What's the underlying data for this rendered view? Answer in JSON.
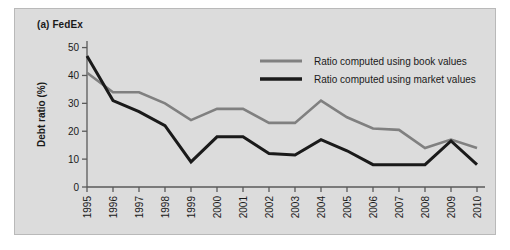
{
  "figure": {
    "panel_label": "(a) FedEx",
    "background_color": "#dcdcdc",
    "border_color": "#b9b9b9"
  },
  "legend": {
    "position": "top-right",
    "entries": [
      {
        "label": "Ratio computed using book values",
        "color": "#808080"
      },
      {
        "label": "Ratio computed using market values",
        "color": "#1a1a1a"
      }
    ]
  },
  "axes": {
    "ylabel": "Debt ratio (%)",
    "xlabel": "Year",
    "yticks": [
      "0",
      "10",
      "20",
      "30",
      "40",
      "50"
    ],
    "xticks": [
      "1995",
      "1996",
      "1997",
      "1998",
      "1999",
      "2000",
      "2001",
      "2002",
      "2003",
      "2004",
      "2005",
      "2006",
      "2007",
      "2008",
      "2009",
      "2010"
    ]
  },
  "chart_data": {
    "type": "line",
    "title": "(a) FedEx",
    "xlabel": "Year",
    "ylabel": "Debt ratio (%)",
    "categories": [
      1995,
      1996,
      1997,
      1998,
      1999,
      2000,
      2001,
      2002,
      2003,
      2004,
      2005,
      2006,
      2007,
      2008,
      2009,
      2010
    ],
    "series": [
      {
        "name": "Ratio computed using book values",
        "color": "#808080",
        "values": [
          41,
          34,
          34,
          30,
          24,
          28,
          28,
          23,
          23,
          31,
          25,
          21,
          20.5,
          14,
          17,
          14
        ]
      },
      {
        "name": "Ratio computed using market values",
        "color": "#1a1a1a",
        "values": [
          47,
          31,
          27,
          22,
          9,
          18,
          18,
          12,
          11.5,
          17,
          13,
          8,
          8,
          8,
          16.5,
          8
        ]
      }
    ],
    "ylim": [
      0,
      52
    ],
    "xlim": [
      1995,
      2010
    ],
    "grid": false,
    "legend_position": "top-right"
  }
}
